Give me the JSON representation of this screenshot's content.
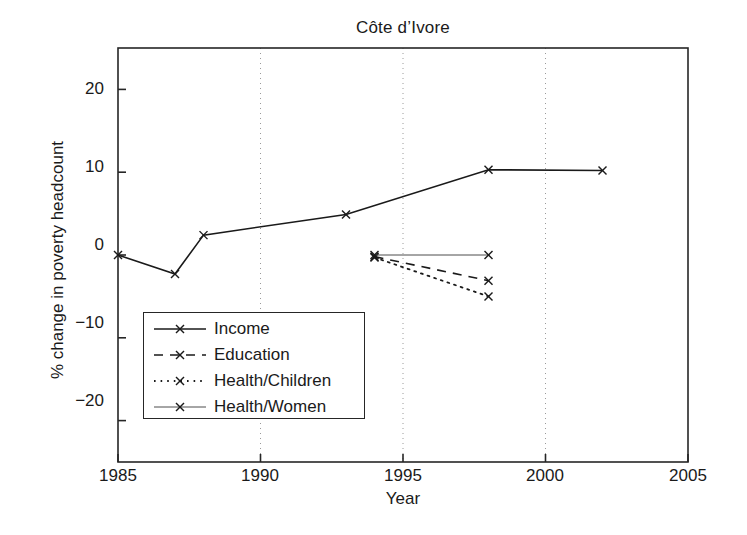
{
  "chart_data": {
    "type": "line",
    "title": "Côte d’Ivore",
    "xlabel": "Year",
    "ylabel": "% change in poverty headcount",
    "xlim": [
      1985,
      2005
    ],
    "ylim": [
      -25,
      25
    ],
    "xticks": [
      1985,
      1990,
      1995,
      2000,
      2005
    ],
    "xtick_labels": [
      "1985",
      "1990",
      "1995",
      "2000",
      "2005"
    ],
    "yticks": [
      20,
      10,
      0,
      -10,
      -20
    ],
    "ytick_labels": [
      "20",
      "10",
      "0",
      "−10",
      "−20"
    ],
    "gridlines_x": [
      1990,
      1995,
      2000
    ],
    "grid": "vertical-dotted",
    "legend_position": "lower-left-inside",
    "series": [
      {
        "name": "Income",
        "style": "solid",
        "marker": "x",
        "linewidth": 1.6,
        "color": "#1a1a1a",
        "x": [
          1985,
          1987,
          1988,
          1993,
          1998,
          2002
        ],
        "values": [
          0.0,
          -2.3,
          2.4,
          4.9,
          10.3,
          10.2
        ]
      },
      {
        "name": "Education",
        "style": "dashed",
        "marker": "x",
        "linewidth": 1.6,
        "color": "#1a1a1a",
        "x": [
          1994,
          1998
        ],
        "values": [
          -0.2,
          -3.1
        ]
      },
      {
        "name": "Health/Children",
        "style": "dotted",
        "marker": "x",
        "linewidth": 1.8,
        "color": "#1a1a1a",
        "x": [
          1994,
          1998
        ],
        "values": [
          -0.3,
          -5.0
        ]
      },
      {
        "name": "Health/Women",
        "style": "solid-thin",
        "marker": "x",
        "linewidth": 1.0,
        "color": "#4d4d4d",
        "x": [
          1994,
          1998
        ],
        "values": [
          0.0,
          0.0
        ]
      }
    ]
  },
  "legend": {
    "items": [
      {
        "label": "Income"
      },
      {
        "label": "Education"
      },
      {
        "label": "Health/Children"
      },
      {
        "label": "Health/Women"
      }
    ]
  },
  "axes": {
    "frame_color": "#262626",
    "grid_color": "#9a9a9a"
  }
}
